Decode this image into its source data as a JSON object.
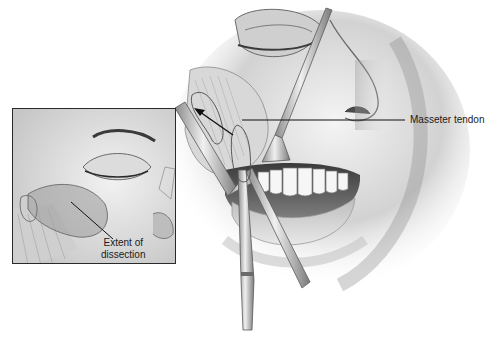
{
  "figure": {
    "type": "surgical-illustration",
    "style": "grayscale pencil rendering",
    "main_view": {
      "description": "Intraoral approach: retracted lip and cheek showing upper teeth, with scissors and retractors dissecting toward the masseter tendon",
      "labels": [
        {
          "id": "masseter-tendon",
          "text": "Masseter tendon"
        }
      ],
      "instruments": [
        "right-angle retractor",
        "malleable retractor",
        "dissecting scissors"
      ]
    },
    "inset": {
      "description": "External lateral view of the eye/cheek region with the dissection area shaded",
      "labels": [
        {
          "id": "extent-of-dissection",
          "line1": "Extent of",
          "line2": "dissection"
        }
      ]
    },
    "colors": {
      "line": "#1a1a1a",
      "frame": "#2a2a2a",
      "shade_dark": "#5a5a5a",
      "shade_mid": "#9a9a9a",
      "shade_light": "#d6d6d6",
      "background": "#ffffff"
    }
  }
}
